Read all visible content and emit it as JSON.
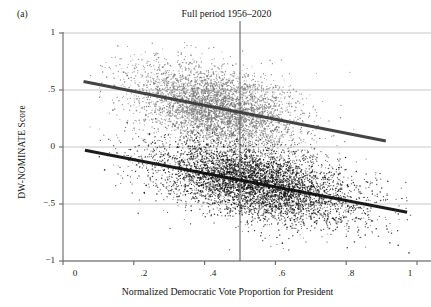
{
  "panel": {
    "label": "(a)"
  },
  "chart_data": {
    "type": "scatter",
    "title": "Full period 1956–2020",
    "xlabel": "Normalized Democratic Vote Proportion for President",
    "ylabel": "DW-NOMINATE Score",
    "xlim": [
      0,
      1
    ],
    "ylim": [
      -1,
      1
    ],
    "grid": true,
    "grid_axis": "y",
    "legend": "none",
    "xticks": [
      0,
      0.2,
      0.4,
      0.6,
      0.8,
      1
    ],
    "xtick_labels": [
      "0",
      ".2",
      ".4",
      ".6",
      ".8",
      "1"
    ],
    "yticks": [
      1,
      0.5,
      0,
      -0.5,
      -1
    ],
    "ytick_labels": [
      "1",
      ".5",
      "0",
      "−.5",
      "−1"
    ],
    "reference_lines": [
      {
        "name": "vertical-midline",
        "orientation": "vertical",
        "x": 0.5,
        "color": "#555555"
      }
    ],
    "series": [
      {
        "name": "Republicans",
        "color": "#777777",
        "n_points": 4200,
        "cloud": {
          "x_mean": 0.435,
          "x_sd": 0.115,
          "y_mean": 0.355,
          "y_sd": 0.175,
          "x_min": 0.05,
          "x_max": 0.93,
          "y_min": -0.12,
          "y_max": 0.99
        },
        "fit_line": {
          "x_start": 0.058,
          "y_start": 0.575,
          "x_end": 0.912,
          "y_end": 0.052,
          "slope": -0.612,
          "intercept": 0.61,
          "color": "#3a3a3a"
        }
      },
      {
        "name": "Democrats",
        "color": "#151515",
        "n_points": 5200,
        "cloud": {
          "x_mean": 0.545,
          "x_sd": 0.145,
          "y_mean": -0.335,
          "y_sd": 0.155,
          "x_min": 0.07,
          "x_max": 0.985,
          "y_min": -0.95,
          "y_max": 0.38
        },
        "fit_line": {
          "x_start": 0.062,
          "y_start": -0.028,
          "x_end": 0.972,
          "y_end": -0.572,
          "slope": -0.598,
          "intercept": 0.009,
          "color": "#0f0f0f"
        }
      }
    ]
  },
  "colors": {
    "axis": "#666666",
    "gridline": "#b9b9b9",
    "republican_points": "#777777",
    "democrat_points": "#151515"
  }
}
